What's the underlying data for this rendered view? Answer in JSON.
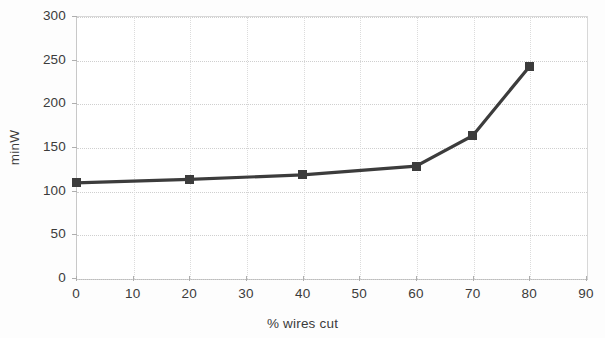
{
  "chart_data": {
    "type": "line",
    "title": "",
    "xlabel": "% wires cut",
    "ylabel": "minW",
    "x": [
      0,
      20,
      40,
      60,
      70,
      80
    ],
    "values": [
      109,
      113,
      118,
      128,
      163,
      242
    ],
    "series": [
      {
        "name": "minW",
        "x": [
          0,
          20,
          40,
          60,
          70,
          80
        ],
        "values": [
          109,
          113,
          118,
          128,
          163,
          242
        ],
        "color": "#3c3c3c",
        "marker": "square"
      }
    ],
    "xlim": [
      0,
      90
    ],
    "ylim": [
      0,
      300
    ],
    "xticks": [
      0,
      10,
      20,
      30,
      40,
      50,
      60,
      70,
      80,
      90
    ],
    "yticks": [
      0,
      50,
      100,
      150,
      200,
      250,
      300
    ],
    "xtick_labels": [
      "0",
      "10",
      "20",
      "30",
      "40",
      "50",
      "60",
      "70",
      "80",
      "90"
    ],
    "ytick_labels": [
      "0",
      "50",
      "100",
      "150",
      "200",
      "250",
      "300"
    ],
    "grid": true,
    "grid_axis": "both",
    "legend": false,
    "legend_position": "none",
    "annotations": []
  },
  "axes": {
    "x_title": "% wires cut",
    "y_title": "minW"
  },
  "colors": {
    "line": "#3c3c3c",
    "marker": "#3c3c3c",
    "grid": "#cfcfcf",
    "axis": "#bcbcbc",
    "text": "#3b3b3b",
    "background": "#ffffff"
  }
}
